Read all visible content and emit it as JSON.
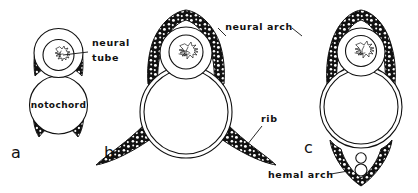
{
  "figure": {
    "type": "anatomical-diagram",
    "panels": [
      {
        "letter": "a",
        "label_letter": "a",
        "structures": [
          "neural tube",
          "notochord",
          "neural arch rudiment"
        ]
      },
      {
        "letter": "b",
        "label_letter": "b",
        "structures": [
          "neural tube",
          "centrum",
          "neural arch",
          "rib"
        ]
      },
      {
        "letter": "c",
        "label_letter": "c",
        "structures": [
          "neural tube",
          "centrum",
          "neural arch",
          "hemal arch"
        ]
      }
    ],
    "callouts": [
      {
        "id": "neural-tube",
        "text_line_1": "neural",
        "text_line_2": "tube",
        "full": "neural tube"
      },
      {
        "id": "notochord",
        "text": "notochord"
      },
      {
        "id": "neural-arch",
        "text": "neural arch"
      },
      {
        "id": "rib",
        "text": "rib"
      },
      {
        "id": "hemal-arch",
        "text": "hemal arch"
      }
    ],
    "colors": {
      "ink": "#111111",
      "paper": "#ffffff",
      "bone_fill": "#111111",
      "lacuna_fill": "#ffffff"
    }
  }
}
